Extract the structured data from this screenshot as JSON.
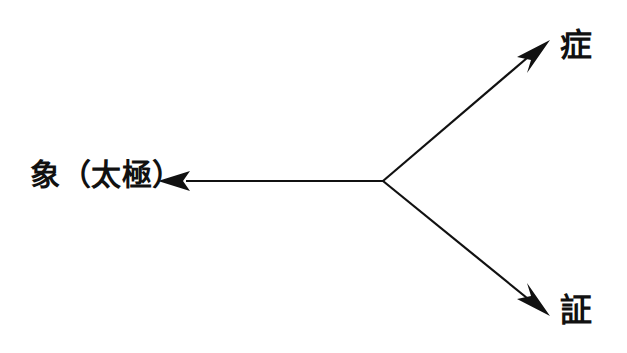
{
  "diagram": {
    "type": "radial-branch-arrow-diagram",
    "background_color": "#ffffff",
    "stroke_color": "#111111",
    "stroke_width": 2,
    "canvas": {
      "width": 627,
      "height": 353
    },
    "junction": {
      "x": 383,
      "y": 181
    },
    "nodes": [
      {
        "id": "origin",
        "label": "象（太極）",
        "direction": "left",
        "arrow_tip": {
          "x": 158,
          "y": 181
        },
        "label_position": {
          "x": 33,
          "y": 181
        }
      },
      {
        "id": "branch-upper",
        "label": "症",
        "direction": "upper-right",
        "arrow_tip": {
          "x": 550,
          "y": 40
        },
        "label_position": {
          "x": 562,
          "y": 46
        }
      },
      {
        "id": "branch-lower",
        "label": "証",
        "direction": "lower-right",
        "arrow_tip": {
          "x": 550,
          "y": 316
        },
        "label_position": {
          "x": 562,
          "y": 311
        }
      }
    ]
  }
}
